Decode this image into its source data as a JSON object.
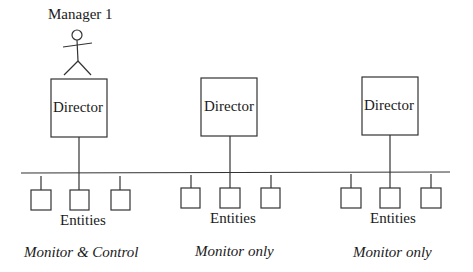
{
  "diagram": {
    "manager": {
      "label": "Manager 1",
      "icon": "stick-figure-icon"
    },
    "groups": [
      {
        "director_label": "Director",
        "entities_label": "Entities",
        "mode_label": "Monitor & Control"
      },
      {
        "director_label": "Director",
        "entities_label": "Entities",
        "mode_label": "Monitor only"
      },
      {
        "director_label": "Director",
        "entities_label": "Entities",
        "mode_label": "Monitor only"
      }
    ],
    "colors": {
      "line": "#333333",
      "text": "#1a1a1a",
      "background": "#ffffff"
    }
  }
}
